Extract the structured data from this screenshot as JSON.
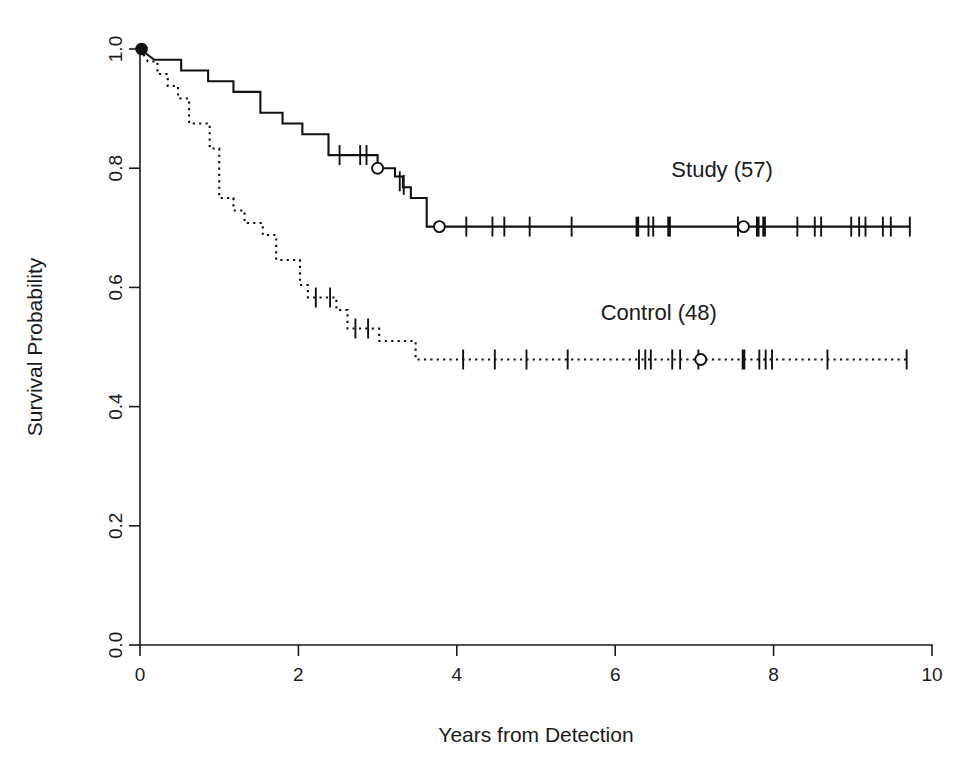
{
  "figure": {
    "kind": "kaplan-meier-survival-plot",
    "background_color": "#ffffff",
    "ink_color": "#111111"
  },
  "chart_data": {
    "type": "line",
    "title": "",
    "subtitle": "",
    "xlabel": "Years from Detection",
    "ylabel": "Survival Probability",
    "xlim": [
      0,
      10
    ],
    "ylim": [
      0.0,
      1.0
    ],
    "xticks": [
      0,
      2,
      4,
      6,
      8,
      10
    ],
    "xtick_labels": [
      "0",
      "2",
      "4",
      "6",
      "8",
      "10"
    ],
    "yticks": [
      0.0,
      0.2,
      0.4,
      0.6,
      0.8,
      1.0
    ],
    "ytick_labels": [
      "0.0",
      "0.2",
      "0.4",
      "0.6",
      "0.8",
      "1.0"
    ],
    "grid": false,
    "legend_position": "inline-annotation",
    "ylabel_rotated": true,
    "ytick_labels_rotated": true,
    "series": [
      {
        "name": "Study (57)",
        "label": "Study (57)",
        "n": 57,
        "linestyle": "solid",
        "color": "#111111",
        "annotation": {
          "text": "Study (57)",
          "x": 7.35,
          "y": 0.785
        },
        "steps": [
          [
            0.0,
            1.0
          ],
          [
            0.18,
            0.982
          ],
          [
            0.52,
            0.982
          ],
          [
            0.52,
            0.964
          ],
          [
            0.86,
            0.964
          ],
          [
            0.86,
            0.946
          ],
          [
            1.18,
            0.946
          ],
          [
            1.18,
            0.928
          ],
          [
            1.52,
            0.928
          ],
          [
            1.52,
            0.893
          ],
          [
            1.8,
            0.893
          ],
          [
            1.8,
            0.875
          ],
          [
            2.05,
            0.875
          ],
          [
            2.05,
            0.857
          ],
          [
            2.38,
            0.857
          ],
          [
            2.38,
            0.822
          ],
          [
            3.0,
            0.822
          ],
          [
            3.0,
            0.8
          ],
          [
            3.22,
            0.8
          ],
          [
            3.22,
            0.786
          ],
          [
            3.32,
            0.786
          ],
          [
            3.32,
            0.768
          ],
          [
            3.42,
            0.768
          ],
          [
            3.42,
            0.75
          ],
          [
            3.62,
            0.75
          ],
          [
            3.62,
            0.702
          ],
          [
            9.72,
            0.702
          ]
        ],
        "censor_ticks": [
          {
            "x": 2.52,
            "y": 0.822,
            "weight": "normal"
          },
          {
            "x": 2.78,
            "y": 0.822,
            "weight": "normal"
          },
          {
            "x": 2.86,
            "y": 0.822,
            "weight": "normal"
          },
          {
            "x": 3.28,
            "y": 0.778,
            "weight": "normal"
          },
          {
            "x": 3.33,
            "y": 0.772,
            "weight": "normal"
          },
          {
            "x": 4.12,
            "y": 0.702,
            "weight": "normal"
          },
          {
            "x": 4.45,
            "y": 0.702,
            "weight": "normal"
          },
          {
            "x": 4.6,
            "y": 0.702,
            "weight": "normal"
          },
          {
            "x": 4.92,
            "y": 0.702,
            "weight": "normal"
          },
          {
            "x": 5.45,
            "y": 0.702,
            "weight": "normal"
          },
          {
            "x": 6.28,
            "y": 0.702,
            "weight": "heavy"
          },
          {
            "x": 6.42,
            "y": 0.702,
            "weight": "normal"
          },
          {
            "x": 6.48,
            "y": 0.702,
            "weight": "normal"
          },
          {
            "x": 6.68,
            "y": 0.702,
            "weight": "heavy"
          },
          {
            "x": 7.55,
            "y": 0.702,
            "weight": "normal"
          },
          {
            "x": 7.8,
            "y": 0.702,
            "weight": "heavy"
          },
          {
            "x": 7.88,
            "y": 0.702,
            "weight": "heavy"
          },
          {
            "x": 8.3,
            "y": 0.702,
            "weight": "normal"
          },
          {
            "x": 8.52,
            "y": 0.702,
            "weight": "normal"
          },
          {
            "x": 8.6,
            "y": 0.702,
            "weight": "normal"
          },
          {
            "x": 8.98,
            "y": 0.702,
            "weight": "normal"
          },
          {
            "x": 9.08,
            "y": 0.702,
            "weight": "normal"
          },
          {
            "x": 9.16,
            "y": 0.702,
            "weight": "normal"
          },
          {
            "x": 9.38,
            "y": 0.702,
            "weight": "normal"
          },
          {
            "x": 9.48,
            "y": 0.702,
            "weight": "normal"
          },
          {
            "x": 9.72,
            "y": 0.702,
            "weight": "normal"
          }
        ],
        "circle_markers": [
          {
            "x": 0.02,
            "y": 1.0
          },
          {
            "x": 3.0,
            "y": 0.8
          },
          {
            "x": 3.78,
            "y": 0.702
          },
          {
            "x": 7.62,
            "y": 0.702
          }
        ]
      },
      {
        "name": "Control (48)",
        "label": "Control (48)",
        "n": 48,
        "linestyle": "dotted",
        "color": "#111111",
        "annotation": {
          "text": "Control (48)",
          "x": 6.55,
          "y": 0.545
        },
        "steps": [
          [
            0.0,
            1.0
          ],
          [
            0.1,
            0.979
          ],
          [
            0.22,
            0.979
          ],
          [
            0.22,
            0.958
          ],
          [
            0.35,
            0.958
          ],
          [
            0.35,
            0.938
          ],
          [
            0.48,
            0.938
          ],
          [
            0.48,
            0.917
          ],
          [
            0.62,
            0.917
          ],
          [
            0.62,
            0.875
          ],
          [
            0.88,
            0.875
          ],
          [
            0.88,
            0.833
          ],
          [
            1.0,
            0.833
          ],
          [
            1.0,
            0.75
          ],
          [
            1.18,
            0.75
          ],
          [
            1.18,
            0.729
          ],
          [
            1.32,
            0.729
          ],
          [
            1.32,
            0.708
          ],
          [
            1.55,
            0.708
          ],
          [
            1.55,
            0.688
          ],
          [
            1.72,
            0.688
          ],
          [
            1.72,
            0.646
          ],
          [
            2.02,
            0.646
          ],
          [
            2.02,
            0.604
          ],
          [
            2.12,
            0.604
          ],
          [
            2.12,
            0.583
          ],
          [
            2.48,
            0.583
          ],
          [
            2.48,
            0.562
          ],
          [
            2.62,
            0.562
          ],
          [
            2.62,
            0.531
          ],
          [
            3.02,
            0.531
          ],
          [
            3.02,
            0.51
          ],
          [
            3.48,
            0.51
          ],
          [
            3.48,
            0.479
          ],
          [
            9.72,
            0.479
          ]
        ],
        "censor_ticks": [
          {
            "x": 2.22,
            "y": 0.583,
            "weight": "normal"
          },
          {
            "x": 2.4,
            "y": 0.583,
            "weight": "normal"
          },
          {
            "x": 2.72,
            "y": 0.531,
            "weight": "normal"
          },
          {
            "x": 2.88,
            "y": 0.531,
            "weight": "normal"
          },
          {
            "x": 4.08,
            "y": 0.479,
            "weight": "normal"
          },
          {
            "x": 4.48,
            "y": 0.479,
            "weight": "normal"
          },
          {
            "x": 4.88,
            "y": 0.479,
            "weight": "normal"
          },
          {
            "x": 5.4,
            "y": 0.479,
            "weight": "normal"
          },
          {
            "x": 6.3,
            "y": 0.479,
            "weight": "normal"
          },
          {
            "x": 6.38,
            "y": 0.479,
            "weight": "normal"
          },
          {
            "x": 6.45,
            "y": 0.479,
            "weight": "normal"
          },
          {
            "x": 6.72,
            "y": 0.479,
            "weight": "normal"
          },
          {
            "x": 6.82,
            "y": 0.479,
            "weight": "normal"
          },
          {
            "x": 7.05,
            "y": 0.479,
            "weight": "normal"
          },
          {
            "x": 7.62,
            "y": 0.479,
            "weight": "heavy"
          },
          {
            "x": 7.82,
            "y": 0.479,
            "weight": "normal"
          },
          {
            "x": 7.9,
            "y": 0.479,
            "weight": "normal"
          },
          {
            "x": 7.98,
            "y": 0.479,
            "weight": "normal"
          },
          {
            "x": 8.68,
            "y": 0.479,
            "weight": "normal"
          },
          {
            "x": 9.68,
            "y": 0.479,
            "weight": "normal"
          }
        ],
        "circle_markers": [
          {
            "x": 7.08,
            "y": 0.479
          }
        ]
      }
    ]
  },
  "axes": {
    "x_title": "Years from Detection",
    "y_title": "Survival Probability"
  }
}
